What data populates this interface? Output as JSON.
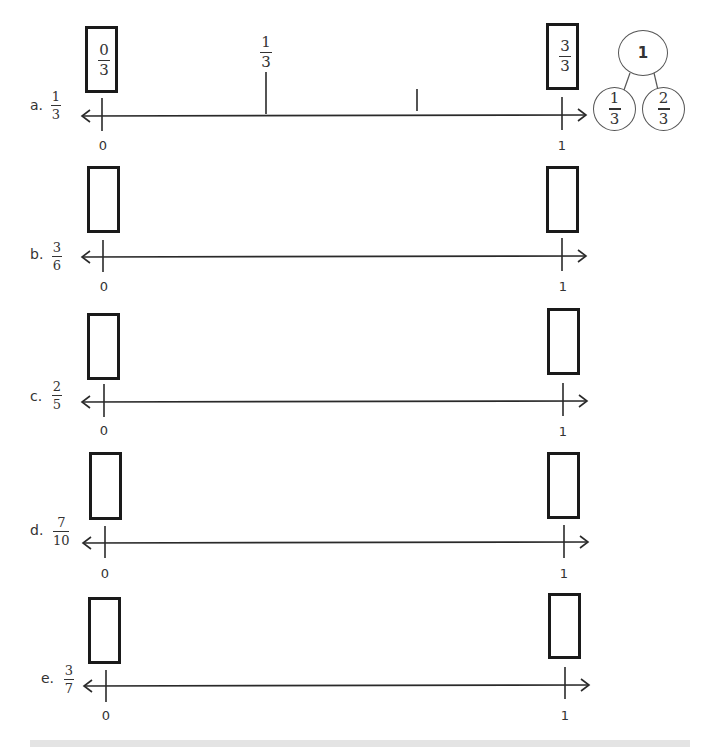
{
  "problems": [
    {
      "letter": "a.",
      "fraction": {
        "numerator": "1",
        "denominator": "3"
      },
      "left_box": {
        "numerator": "0",
        "denominator": "3"
      },
      "right_box": {
        "numerator": "3",
        "denominator": "3"
      },
      "axis_start_label": "0",
      "axis_end_label": "1",
      "intermediate_tick_labels": [
        {
          "numerator": "1",
          "denominator": "3"
        }
      ]
    },
    {
      "letter": "b.",
      "fraction": {
        "numerator": "3",
        "denominator": "6"
      },
      "axis_start_label": "0",
      "axis_end_label": "1"
    },
    {
      "letter": "c.",
      "fraction": {
        "numerator": "2",
        "denominator": "5"
      },
      "axis_start_label": "0",
      "axis_end_label": "1"
    },
    {
      "letter": "d.",
      "fraction": {
        "numerator": "7",
        "denominator": "10"
      },
      "axis_start_label": "0",
      "axis_end_label": "1"
    },
    {
      "letter": "e.",
      "fraction": {
        "numerator": "3",
        "denominator": "7"
      },
      "axis_start_label": "0",
      "axis_end_label": "1"
    }
  ],
  "number_bond": {
    "whole": "1",
    "parts": [
      {
        "numerator": "1",
        "denominator": "3"
      },
      {
        "numerator": "2",
        "denominator": "3"
      }
    ]
  }
}
